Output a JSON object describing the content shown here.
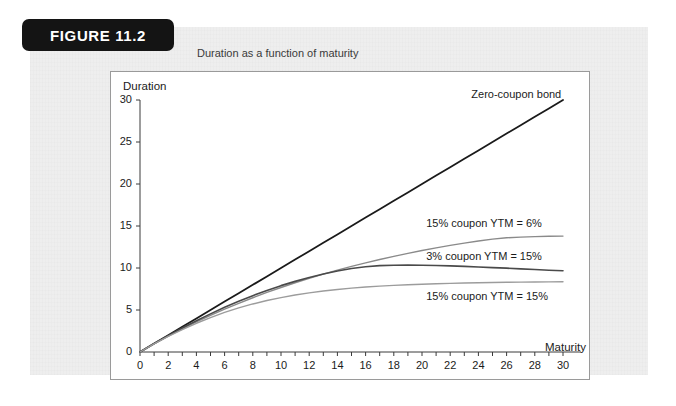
{
  "figure": {
    "badge_label": "FIGURE 11.2",
    "caption": "Duration as a function of maturity"
  },
  "colors": {
    "badge_bg": "#141414",
    "panel_bg": "#eeeeee",
    "plot_bg": "#ffffff",
    "plot_border": "#9a9a9a",
    "axis": "#3a3a3a",
    "zero_coupon": "#1a1a1a",
    "coupon_3_ytm15": "#4a4a4a",
    "coupon_15_ytm6": "#8a8a8a",
    "coupon_15_ytm15": "#9c9c9c"
  },
  "chart_data": {
    "type": "line",
    "title": "Duration as a function of maturity",
    "xlabel": "Maturity",
    "ylabel": "Duration",
    "xlim": [
      0,
      30
    ],
    "ylim": [
      0,
      30
    ],
    "grid": false,
    "legend_position": "inline-right",
    "xticks": [
      0,
      2,
      4,
      6,
      8,
      10,
      12,
      14,
      16,
      18,
      20,
      22,
      24,
      26,
      28,
      30
    ],
    "yticks": [
      0,
      5,
      10,
      15,
      20,
      25,
      30
    ],
    "x": [
      0,
      1,
      2,
      3,
      4,
      5,
      6,
      7,
      8,
      9,
      10,
      11,
      12,
      13,
      14,
      15,
      16,
      17,
      18,
      19,
      20,
      21,
      22,
      23,
      24,
      25,
      26,
      27,
      28,
      29,
      30
    ],
    "series": [
      {
        "name": "Zero-coupon bond",
        "color": "#1a1a1a",
        "width": 1.8,
        "label_x": 23.5,
        "label_y": 30.6,
        "values": [
          0,
          1,
          2,
          3,
          4,
          5,
          6,
          7,
          8,
          9,
          10,
          11,
          12,
          13,
          14,
          15,
          16,
          17,
          18,
          19,
          20,
          21,
          22,
          23,
          24,
          25,
          26,
          27,
          28,
          29,
          30
        ]
      },
      {
        "name": "15% coupon YTM = 6%",
        "color": "#8a8a8a",
        "width": 1.4,
        "label_x": 20.3,
        "label_y": 15.2,
        "values": [
          0,
          0.97,
          1.89,
          2.76,
          3.58,
          4.36,
          5.1,
          5.8,
          6.46,
          7.09,
          7.68,
          8.24,
          8.77,
          9.27,
          9.74,
          10.19,
          10.61,
          11.01,
          11.39,
          11.74,
          12.08,
          12.39,
          12.69,
          12.96,
          13.21,
          13.44,
          13.6,
          13.68,
          13.74,
          13.78,
          13.8
        ]
      },
      {
        "name": "3% coupon YTM = 15%",
        "color": "#4a4a4a",
        "width": 1.6,
        "label_x": 20.3,
        "label_y": 11.3,
        "values": [
          0,
          0.99,
          1.94,
          2.85,
          3.72,
          4.54,
          5.32,
          6.04,
          6.71,
          7.33,
          7.9,
          8.41,
          8.87,
          9.28,
          9.64,
          9.95,
          10.15,
          10.28,
          10.33,
          10.34,
          10.33,
          10.3,
          10.25,
          10.19,
          10.12,
          10.05,
          9.98,
          9.9,
          9.82,
          9.74,
          9.68
        ]
      },
      {
        "name": "15% coupon YTM = 15%",
        "color": "#9c9c9c",
        "width": 1.4,
        "label_x": 20.3,
        "label_y": 6.5,
        "values": [
          0,
          0.96,
          1.85,
          2.67,
          3.42,
          4.1,
          4.71,
          5.25,
          5.72,
          6.13,
          6.48,
          6.78,
          7.04,
          7.26,
          7.44,
          7.6,
          7.73,
          7.84,
          7.93,
          8.01,
          8.07,
          8.13,
          8.17,
          8.21,
          8.25,
          8.28,
          8.3,
          8.32,
          8.34,
          8.35,
          8.36
        ]
      }
    ]
  }
}
